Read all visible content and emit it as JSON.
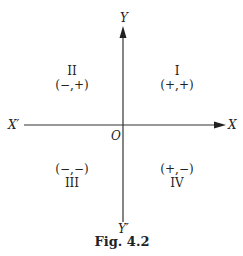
{
  "figure": {
    "caption": "Fig.  4.2",
    "axes": {
      "x_positive": "X",
      "x_negative": "X′",
      "y_positive": "Y",
      "y_negative": "Y′",
      "origin": "O"
    },
    "quadrants": [
      {
        "numeral": "I",
        "signs": "(+,+)"
      },
      {
        "numeral": "II",
        "signs": "(−,+)"
      },
      {
        "numeral": "III",
        "signs": "(−,−)"
      },
      {
        "numeral": "IV",
        "signs": "(+,−)"
      }
    ]
  }
}
